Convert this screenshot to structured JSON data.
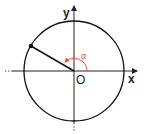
{
  "diagram": {
    "labels": {
      "x_axis": "x",
      "y_axis": "y",
      "origin": "O",
      "angle": "α"
    },
    "colors": {
      "axis": "#222222",
      "circle": "#111111",
      "angle_arc": "#e0553a"
    },
    "angle_degrees": 150
  }
}
